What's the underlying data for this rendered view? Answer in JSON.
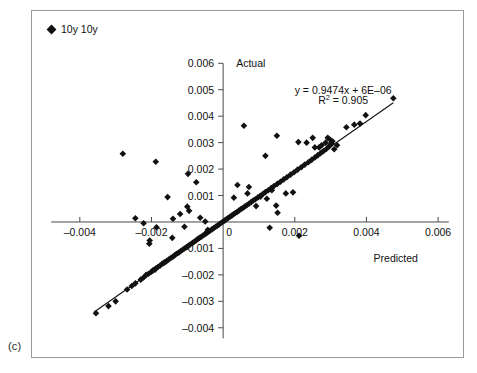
{
  "figure": {
    "panel_label": "(c)",
    "legend": [
      {
        "label": "10y 10y",
        "marker": "diamond-marker",
        "color": "#111111"
      }
    ]
  },
  "chart_data": {
    "type": "scatter",
    "title": "",
    "xlabel": "Predicted",
    "ylabel": "Actual",
    "xlim": [
      -0.005,
      0.0065
    ],
    "ylim": [
      -0.0045,
      0.0062
    ],
    "xticks": [
      -0.004,
      -0.002,
      0,
      0.002,
      0.004,
      0.006
    ],
    "xtick_labels": [
      "–0.004",
      "–0.002",
      "0",
      "0.002",
      "0.004",
      "0.006"
    ],
    "yticks": [
      0.006,
      0.005,
      0.004,
      0.003,
      0.002,
      0.001,
      -0.001,
      -0.002,
      -0.003,
      -0.004
    ],
    "ytick_labels": [
      "0.006",
      "0.005",
      "0.004",
      "0.003",
      "0.002",
      "0.001",
      "–0.001",
      "–0.002",
      "–0.003",
      "–0.004"
    ],
    "grid": false,
    "legend_position": "top-left-outside",
    "annotations": [
      {
        "name": "regression-equation",
        "text": "y = 0.9474x + 6E–06"
      },
      {
        "name": "r-squared",
        "text_prefix": "R",
        "text_sup": "2",
        "text_suffix": " = 0.905"
      }
    ],
    "fit": {
      "slope": 0.9474,
      "intercept": 6e-06,
      "r_squared": 0.905,
      "x_start": -0.0036,
      "x_end": 0.00475
    },
    "series": [
      {
        "name": "10y 10y",
        "marker": "diamond",
        "color": "#111111",
        "points": [
          [
            -0.00355,
            -0.00345
          ],
          [
            -0.003,
            -0.003
          ],
          [
            -0.00268,
            -0.00255
          ],
          [
            -0.00245,
            -0.00232
          ],
          [
            -0.0023,
            -0.00218
          ],
          [
            -0.00222,
            -0.0021
          ],
          [
            -0.00215,
            -0.002
          ],
          [
            -0.00208,
            -0.00196
          ],
          [
            -0.002,
            -0.00188
          ],
          [
            -0.00195,
            -0.00182
          ],
          [
            -0.00188,
            -0.00176
          ],
          [
            -0.00182,
            -0.0017
          ],
          [
            -0.00176,
            -0.00165
          ],
          [
            -0.0017,
            -0.00158
          ],
          [
            -0.00164,
            -0.00152
          ],
          [
            -0.00158,
            -0.00148
          ],
          [
            -0.00152,
            -0.00142
          ],
          [
            -0.00146,
            -0.00136
          ],
          [
            -0.0014,
            -0.00131
          ],
          [
            -0.00135,
            -0.00126
          ],
          [
            -0.0013,
            -0.0012
          ],
          [
            -0.00124,
            -0.00116
          ],
          [
            -0.00118,
            -0.0011
          ],
          [
            -0.00113,
            -0.00105
          ],
          [
            -0.00108,
            -0.001
          ],
          [
            -0.00102,
            -0.00095
          ],
          [
            -0.00097,
            -0.0009
          ],
          [
            -0.00092,
            -0.00085
          ],
          [
            -0.00086,
            -0.0008
          ],
          [
            -0.00081,
            -0.00075
          ],
          [
            -0.00076,
            -0.0007
          ],
          [
            -0.00071,
            -0.00065
          ],
          [
            -0.00066,
            -0.0006
          ],
          [
            -0.00061,
            -0.00056
          ],
          [
            -0.00056,
            -0.00051
          ],
          [
            -0.00051,
            -0.00046
          ],
          [
            -0.00046,
            -0.00042
          ],
          [
            -0.00041,
            -0.00037
          ],
          [
            -0.00036,
            -0.00032
          ],
          [
            -0.00031,
            -0.00028
          ],
          [
            -0.00026,
            -0.00023
          ],
          [
            -0.00021,
            -0.00018
          ],
          [
            -0.00016,
            -0.00014
          ],
          [
            -0.00011,
            -9e-05
          ],
          [
            -6e-05,
            -4e-05
          ],
          [
            -1e-05,
            1e-05
          ],
          [
            4e-05,
            5e-05
          ],
          [
            9e-05,
            0.0001
          ],
          [
            0.00014,
            0.00015
          ],
          [
            0.00019,
            0.0002
          ],
          [
            0.00024,
            0.00024
          ],
          [
            0.00029,
            0.00029
          ],
          [
            0.00034,
            0.00034
          ],
          [
            0.00039,
            0.00038
          ],
          [
            0.00044,
            0.00043
          ],
          [
            0.00049,
            0.00048
          ],
          [
            0.00054,
            0.00052
          ],
          [
            0.0006,
            0.00058
          ],
          [
            0.00066,
            0.00063
          ],
          [
            0.00072,
            0.00069
          ],
          [
            0.00078,
            0.00075
          ],
          [
            0.00084,
            0.00081
          ],
          [
            0.0009,
            0.00086
          ],
          [
            0.00097,
            0.00093
          ],
          [
            0.00104,
            0.00099
          ],
          [
            0.00111,
            0.00106
          ],
          [
            0.00118,
            0.00113
          ],
          [
            0.00126,
            0.0012
          ],
          [
            0.00134,
            0.00128
          ],
          [
            0.00142,
            0.00136
          ],
          [
            0.00151,
            0.00144
          ],
          [
            0.0016,
            0.00152
          ],
          [
            0.00169,
            0.00161
          ],
          [
            0.00178,
            0.00169
          ],
          [
            0.00188,
            0.00179
          ],
          [
            0.00198,
            0.00188
          ],
          [
            0.00208,
            0.00198
          ],
          [
            0.00218,
            0.00207
          ],
          [
            0.00228,
            0.00217
          ],
          [
            0.00238,
            0.00226
          ],
          [
            0.00247,
            0.00235
          ],
          [
            0.00256,
            0.00244
          ],
          [
            0.00264,
            0.00252
          ],
          [
            0.00272,
            0.0026
          ],
          [
            0.0028,
            0.00268
          ],
          [
            0.00288,
            0.00276
          ],
          [
            0.00296,
            0.00286
          ],
          [
            0.003,
            0.00292
          ],
          [
            0.00302,
            0.00298
          ],
          [
            0.00305,
            0.00305
          ],
          [
            0.00298,
            0.00312
          ],
          [
            0.00292,
            0.00318
          ],
          [
            0.00286,
            0.003
          ],
          [
            0.00275,
            0.0029
          ],
          [
            0.00268,
            0.00282
          ],
          [
            -0.0028,
            0.00258
          ],
          [
            -0.00188,
            0.00228
          ],
          [
            -0.00098,
            0.00182
          ],
          [
            -0.00075,
            0.0015
          ],
          [
            -0.00155,
            0.00094
          ],
          [
            -0.00245,
            0.00014
          ],
          [
            -0.00222,
            -5e-05
          ],
          [
            -0.00186,
            -0.0002
          ],
          [
            -0.00205,
            -0.0007
          ],
          [
            -0.00206,
            -0.00082
          ],
          [
            -0.0012,
            0.0003
          ],
          [
            -0.0014,
            0.00012
          ],
          [
            -0.00108,
            -0.00018
          ],
          [
            -0.00095,
            0.00042
          ],
          [
            -0.00064,
            0.00016
          ],
          [
            -0.0005,
            2e-05
          ],
          [
            -0.00043,
            -0.0003
          ],
          [
            0.0003,
            0.00092
          ],
          [
            0.00068,
            0.00108
          ],
          [
            0.00092,
            0.0006
          ],
          [
            0.00104,
            0.00096
          ],
          [
            0.00122,
            0.00088
          ],
          [
            0.00136,
            0.0012
          ],
          [
            0.00148,
            0.00062
          ],
          [
            0.00152,
            0.00035
          ],
          [
            0.0013,
            -0.00022
          ],
          [
            0.00212,
            -0.00052
          ],
          [
            0.00175,
            0.00108
          ],
          [
            0.00195,
            0.00112
          ],
          [
            0.00072,
            0.00132
          ],
          [
            0.0004,
            0.0014
          ],
          [
            0.00118,
            0.0025
          ],
          [
            0.0015,
            0.00326
          ],
          [
            0.00058,
            0.00364
          ],
          [
            0.0021,
            0.00302
          ],
          [
            0.00233,
            0.003
          ],
          [
            0.0025,
            0.00318
          ],
          [
            0.00256,
            0.00282
          ],
          [
            0.0031,
            0.00275
          ],
          [
            0.00318,
            0.0029
          ],
          [
            0.00344,
            0.00358
          ],
          [
            0.00366,
            0.00368
          ],
          [
            0.00382,
            0.00372
          ],
          [
            0.00398,
            0.00404
          ],
          [
            0.00475,
            0.00468
          ],
          [
            -0.0032,
            -0.00318
          ],
          [
            -0.00255,
            -0.00242
          ],
          [
            -0.0019,
            -0.0018
          ],
          [
            -0.00165,
            -0.00155
          ],
          [
            -0.00142,
            -0.0006
          ],
          [
            -0.001,
            0.00058
          ]
        ]
      }
    ]
  }
}
